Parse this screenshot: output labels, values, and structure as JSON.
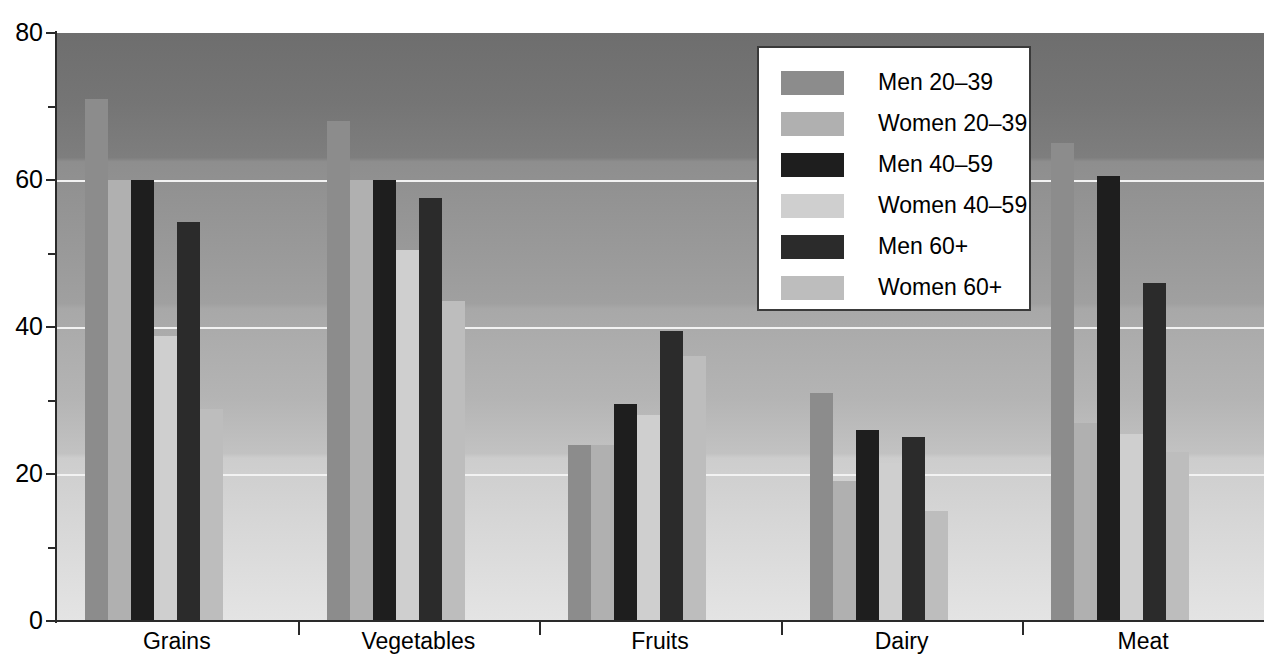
{
  "chart_data": {
    "type": "bar",
    "title": "",
    "xlabel": "",
    "ylabel": "",
    "ylim": [
      0,
      80
    ],
    "yticks": [
      0,
      20,
      40,
      60,
      80
    ],
    "yticks_minor": [
      10,
      30,
      50,
      70
    ],
    "ytick_labels": [
      "0",
      "20",
      "40",
      "60",
      "80"
    ],
    "grid": "horizontal gridlines at 20, 40, 60 (white)",
    "legend_position": "top-right inside plot area",
    "categories": [
      "Grains",
      "Vegetables",
      "Fruits",
      "Dairy",
      "Meat"
    ],
    "series": [
      {
        "name": "Men 20–39",
        "color": "#8c8c8c",
        "values": [
          71.0,
          68.0,
          24.0,
          31.0,
          65.0
        ]
      },
      {
        "name": "Women 20–39",
        "color": "#b0b0b0",
        "values": [
          60.0,
          60.0,
          24.0,
          19.0,
          27.0
        ]
      },
      {
        "name": "Men 40–59",
        "color": "#1e1e1e",
        "values": [
          60.0,
          60.0,
          29.5,
          26.0,
          60.5
        ]
      },
      {
        "name": "Women 40–59",
        "color": "#cfcfcf",
        "values": [
          38.8,
          50.5,
          28.0,
          21.5,
          25.5
        ]
      },
      {
        "name": "Men 60+",
        "color": "#2b2b2b",
        "values": [
          54.3,
          57.5,
          39.5,
          25.0,
          46.0
        ]
      },
      {
        "name": "Women 60+",
        "color": "#bdbdbd",
        "values": [
          28.8,
          43.5,
          36.0,
          15.0,
          23.0
        ]
      }
    ]
  },
  "legend": {
    "items": [
      {
        "label": "Men 20–39",
        "swatch": "#8c8c8c"
      },
      {
        "label": "Women 20–39",
        "swatch": "#b0b0b0"
      },
      {
        "label": "Men 40–59",
        "swatch": "#1e1e1e"
      },
      {
        "label": "Women 40–59",
        "swatch": "#cfcfcf"
      },
      {
        "label": "Men 60+",
        "swatch": "#2b2b2b"
      },
      {
        "label": "Women 60+",
        "swatch": "#bdbdbd"
      }
    ]
  },
  "axes": {
    "y_labels": [
      "80",
      "60",
      "40",
      "20",
      "0"
    ],
    "x_labels": [
      "Grains",
      "Vegetables",
      "Fruits",
      "Dairy",
      "Meat"
    ]
  },
  "colors": {
    "axis": "#2a2a2a",
    "gridline": "#f2f2f2",
    "legend_background": "#ffffff",
    "legend_border": "#3a3a3a",
    "plot_top": "#6e6e6e",
    "plot_bottom": "#e4e4e4"
  }
}
